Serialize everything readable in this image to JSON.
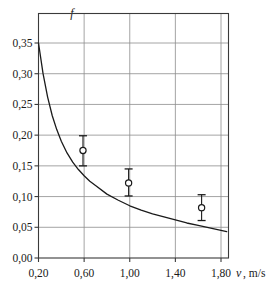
{
  "chart_data": {
    "type": "line",
    "title": "",
    "xlabel": "v, m/s",
    "ylabel": "f",
    "y_axis_symbol": "f",
    "x_axis_symbol": "v",
    "x_axis_unit": "m/s",
    "xlim": [
      0.2,
      1.85
    ],
    "ylim": [
      0.0,
      0.355
    ],
    "grid": true,
    "legend": "none",
    "decimal_separator": ",",
    "xticks": [
      0.2,
      0.6,
      1.0,
      1.4,
      1.8
    ],
    "xtick_labels": [
      "0,20",
      "0,60",
      "1,00",
      "1,40",
      "1,80"
    ],
    "yticks": [
      0.0,
      0.05,
      0.1,
      0.15,
      0.2,
      0.25,
      0.3,
      0.35
    ],
    "ytick_labels": [
      "0,00",
      "0,05",
      "0,10",
      "0,15",
      "0,20",
      "0,25",
      "0,30",
      "0,35"
    ],
    "series": [
      {
        "name": "theoretical-curve",
        "type": "line",
        "color": "#1a1a1a",
        "x": [
          0.2,
          0.24,
          0.28,
          0.32,
          0.36,
          0.4,
          0.45,
          0.5,
          0.55,
          0.6,
          0.65,
          0.7,
          0.8,
          0.9,
          1.0,
          1.1,
          1.2,
          1.3,
          1.4,
          1.5,
          1.6,
          1.7,
          1.8,
          1.85
        ],
        "values": [
          0.35,
          0.3,
          0.262,
          0.232,
          0.209,
          0.19,
          0.171,
          0.156,
          0.144,
          0.134,
          0.125,
          0.118,
          0.104,
          0.094,
          0.085,
          0.078,
          0.072,
          0.067,
          0.062,
          0.057,
          0.053,
          0.049,
          0.045,
          0.043
        ]
      },
      {
        "name": "measured-points",
        "type": "scatter",
        "marker": "open-circle",
        "color": "#1a1a1a",
        "points": [
          {
            "x": 0.59,
            "y": 0.175,
            "yerr_low": 0.15,
            "yerr_high": 0.199
          },
          {
            "x": 0.99,
            "y": 0.122,
            "yerr_low": 0.101,
            "yerr_high": 0.145
          },
          {
            "x": 1.63,
            "y": 0.082,
            "yerr_low": 0.061,
            "yerr_high": 0.103
          }
        ]
      }
    ]
  },
  "axis": {
    "y_symbol": "f",
    "x_symbol": "v",
    "x_unit": ", m/s"
  }
}
